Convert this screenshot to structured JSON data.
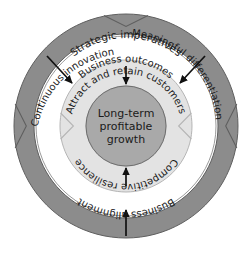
{
  "diagram": {
    "type": "concentric-rings",
    "center": {
      "line1": "Long-term",
      "line2": "profitable",
      "line3": "growth",
      "fill": "#a9a9a9",
      "stroke": "#6e6e6e"
    },
    "rings": [
      {
        "name": "outer-ring",
        "fill": "#8c8c8c",
        "stroke": "#5f5f5f",
        "labels": [
          "Strategic imperatives",
          "Continuous innovation",
          "Meaningful differentiation",
          "Business alignment"
        ]
      },
      {
        "name": "middle-ring",
        "fill": "#ffffff",
        "stroke": "#9a9a9a",
        "labels": [
          "Business outcomes"
        ]
      },
      {
        "name": "inner-ring",
        "fill": "#e3e3e3",
        "stroke": "#b5b5b5",
        "labels": [
          "Attract and retain customers",
          "Competitive resilience"
        ]
      }
    ],
    "labels": {
      "strategic_imperatives": "Strategic imperatives",
      "continuous_innovation": "Continuous innovation",
      "meaningful_differentiation": "Meaningful differentiation",
      "business_outcomes": "Business outcomes",
      "attract_retain": "Attract and retain customers",
      "competitive_resilience": "Competitive resilience",
      "business_alignment": "Business alignment",
      "center_line1": "Long-term",
      "center_line2": "profitable",
      "center_line3": "growth"
    },
    "colors": {
      "outer_ring": "#8c8c8c",
      "inner_ring": "#e3e3e3",
      "center": "#a9a9a9",
      "arrow": "#111111",
      "text": "#1a1a1a",
      "background": "#ffffff"
    },
    "arrows": [
      {
        "name": "innovation-inward-arrow",
        "direction": "down-right"
      },
      {
        "name": "differentiation-inward-arrow",
        "direction": "down-left"
      },
      {
        "name": "attract-to-center-arrow",
        "direction": "down"
      },
      {
        "name": "resilience-to-center-arrow",
        "direction": "up"
      },
      {
        "name": "alignment-to-resilience-arrow",
        "direction": "up"
      }
    ]
  }
}
